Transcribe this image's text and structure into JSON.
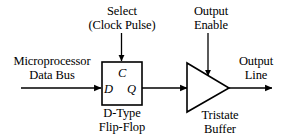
{
  "diagram": {
    "type": "digital-logic-block-diagram",
    "background_color": "#ffffff",
    "stroke_color": "#000000",
    "width": 291,
    "height": 139,
    "labels": {
      "input_source_line1": "Microprocessor",
      "input_source_line2": "Data Bus",
      "select_line1": "Select",
      "select_line2": "(Clock Pulse)",
      "output_enable_line1": "Output",
      "output_enable_line2": "Enable",
      "output_line1": "Output",
      "output_line2": "Line",
      "flipflop_caption_line1": "D-Type",
      "flipflop_caption_line2": "Flip-Flop",
      "tristate_caption_line1": "Tristate",
      "tristate_caption_line2": "Buffer"
    },
    "pins": {
      "clock": "C",
      "data": "D",
      "q_output": "Q"
    }
  }
}
